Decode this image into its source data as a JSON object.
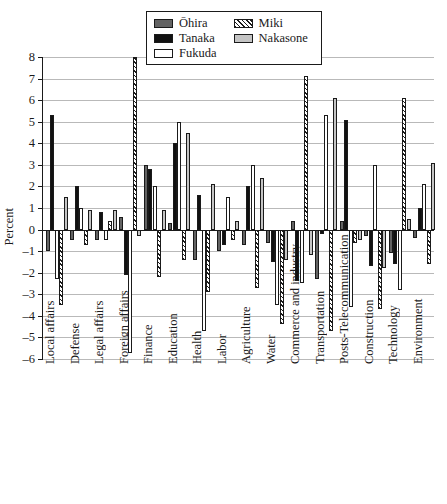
{
  "chart_data": {
    "type": "bar",
    "title": "",
    "subtitle": "",
    "xlabel": "",
    "ylabel": "Percent",
    "ylim": [
      -6,
      8
    ],
    "ytick_labels": [
      "8",
      "7",
      "6",
      "5",
      "4",
      "3",
      "2",
      "1",
      "0",
      "-1",
      "-2",
      "-3",
      "-4",
      "-5",
      "-6"
    ],
    "ytick_values": [
      8,
      7,
      6,
      5,
      4,
      3,
      2,
      1,
      0,
      -1,
      -2,
      -3,
      -4,
      -5,
      -6
    ],
    "grid": true,
    "legend_position": "top-center",
    "categories": [
      "Local affairs",
      "Defense",
      "Legal affairs",
      "Foreign affairs",
      "Finance",
      "Education",
      "Health",
      "Labor",
      "Agriculture",
      "Water",
      "Commerce and industry",
      "Transportation",
      "Posts-Telecommunication",
      "Construction",
      "Technology",
      "Environment"
    ],
    "series": [
      {
        "name": "Ōhira",
        "color": "#636363",
        "pattern": "solid-dark-gray",
        "values": [
          -1.0,
          -0.5,
          -0.5,
          0.6,
          3.0,
          0.3,
          -1.4,
          -1.0,
          -0.7,
          -0.6,
          0.4,
          -2.3,
          0.4,
          -0.3,
          -1.1,
          -0.4
        ]
      },
      {
        "name": "Tanaka",
        "color": "#111111",
        "pattern": "solid-black",
        "values": [
          5.3,
          2.0,
          0.8,
          -2.1,
          2.8,
          4.0,
          1.6,
          -0.7,
          2.0,
          -1.5,
          -2.4,
          -0.2,
          5.1,
          -1.7,
          -1.6,
          1.0
        ]
      },
      {
        "name": "Fukuda",
        "color": "#ffffff",
        "pattern": "open-white",
        "values": [
          -2.3,
          1.0,
          -0.5,
          -5.7,
          2.0,
          5.0,
          -4.7,
          1.5,
          3.0,
          -3.5,
          -2.5,
          5.3,
          -3.6,
          3.0,
          -2.8,
          2.1
        ]
      },
      {
        "name": "Miki",
        "color": "#ffffff",
        "pattern": "diagonal-hatch",
        "values": [
          -3.5,
          -0.7,
          0.4,
          8.0,
          -2.2,
          -1.4,
          -2.9,
          -0.5,
          -2.7,
          -4.4,
          7.1,
          -4.7,
          -0.6,
          -3.7,
          6.1,
          -1.6
        ]
      },
      {
        "name": "Nakasone",
        "color": "#c4c4c4",
        "pattern": "solid-light-gray",
        "values": [
          1.5,
          0.9,
          0.9,
          -0.3,
          0.9,
          4.5,
          2.1,
          0.4,
          2.4,
          -1.4,
          -1.2,
          6.1,
          -0.5,
          -1.8,
          0.5,
          3.1
        ]
      }
    ]
  }
}
